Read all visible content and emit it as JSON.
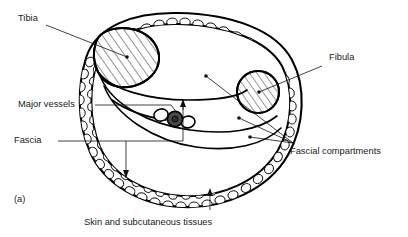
{
  "figure": {
    "panel_label": "(a)",
    "caption_bottom": "Skin and subcutaneous tissues"
  },
  "labels": {
    "tibia": "Tibia",
    "fibula": "Fibula",
    "major_vessels": "Major vessels",
    "fascia": "Fascia",
    "fascial_compartments": "Fascial compartments",
    "skin_subcutaneous": "Skin and subcutaneous tissues"
  },
  "colors": {
    "ink": "#000000",
    "background": "#ffffff",
    "vessel_fill": "#4a4a4a",
    "text": "#1a1a1a"
  },
  "structures": {
    "tibia_shape": "triangular-hatched-bone",
    "fibula_shape": "circular-hatched-bone",
    "vessel_bundle": "three-vessel-cluster",
    "subcutaneous_texture": "cobblestone-fat-lobules"
  }
}
